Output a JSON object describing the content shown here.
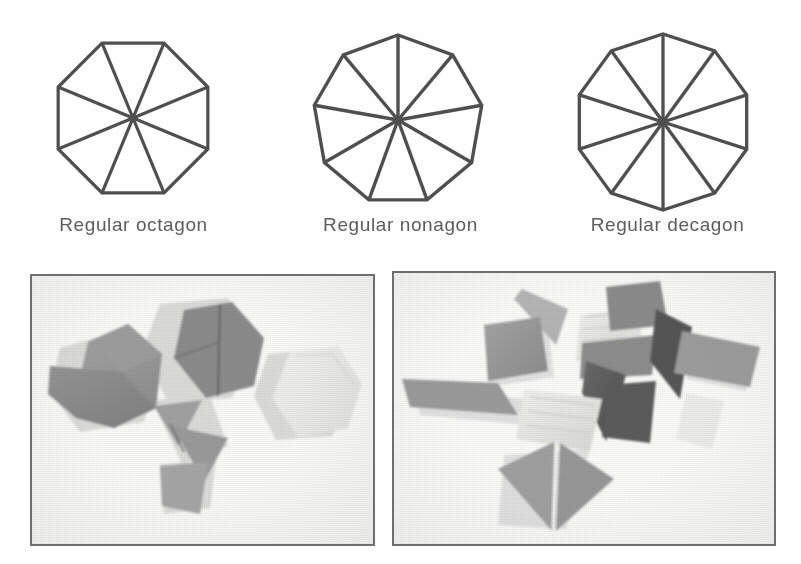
{
  "figure": {
    "background_color": "#fefefe",
    "line_color": "#4f4f4f",
    "label_color": "#5d5d5d"
  },
  "polygons": [
    {
      "name": "octagon",
      "label": "Regular octagon",
      "sides": 8,
      "cx": 133,
      "cy": 118,
      "radius": 81,
      "rotation_deg": 22.5,
      "stroke_width": 3.2,
      "radii_drawn": 8
    },
    {
      "name": "nonagon",
      "label": "Regular nonagon",
      "sides": 9,
      "cx": 131,
      "cy": 120,
      "radius": 85,
      "rotation_deg": -90,
      "stroke_width": 3.4,
      "radii_drawn": 9
    },
    {
      "name": "decagon",
      "label": "Regular decagon",
      "sides": 10,
      "cx": 129,
      "cy": 122,
      "radius": 88,
      "rotation_deg": 18,
      "stroke_width": 3.3,
      "radii_drawn": 10
    }
  ],
  "photos": [
    {
      "name": "hexagon-pieces-photo",
      "alt_text": "Photograph of grey hexagonal card pieces, some cut into triangular sectors",
      "frame_color": "#6f6f6f",
      "paper_color": "#fbfbfa",
      "pieces": [
        {
          "id": "hexagon-grey-left",
          "kind": "hexagon",
          "shade": "#9a9a9a"
        },
        {
          "id": "hexagon-sector-left-upper",
          "kind": "sector",
          "shade": "#8f8f8f"
        },
        {
          "id": "hexagon-dark-centre",
          "kind": "hexagon",
          "shade": "#8a8a8a"
        },
        {
          "id": "hexagon-white-right",
          "kind": "hexagon",
          "shade": "#efefec"
        },
        {
          "id": "triangle-upper",
          "kind": "triangle",
          "shade": "#a3a3a3"
        },
        {
          "id": "triangle-middle",
          "kind": "triangle",
          "shade": "#9d9d9d"
        },
        {
          "id": "triangle-lower",
          "kind": "triangle",
          "shade": "#a8a8a8"
        }
      ]
    },
    {
      "name": "rhombus-pieces-photo",
      "alt_text": "Photograph of scattered grey rhombus and triangular tile pieces",
      "frame_color": "#6f6f6f",
      "paper_color": "#fcfcfb",
      "pieces": [
        {
          "id": "rhombus-thin-top",
          "kind": "rhombus",
          "shade": "#b4b4b4"
        },
        {
          "id": "rhombus-top-left",
          "kind": "rhombus",
          "shade": "#9a9a9a"
        },
        {
          "id": "rhombus-left",
          "kind": "rhombus",
          "shade": "#9c9c9c"
        },
        {
          "id": "rhombus-pale-centre",
          "kind": "rhombus",
          "shade": "#e4e4e1"
        },
        {
          "id": "rhombus-mid-grey",
          "kind": "rhombus",
          "shade": "#8e8e8e"
        },
        {
          "id": "triangle-dark-centre",
          "kind": "triangle",
          "shade": "#606060"
        },
        {
          "id": "triangle-dark-right",
          "kind": "triangle",
          "shade": "#545454"
        },
        {
          "id": "rhombus-top-right",
          "kind": "rhombus",
          "shade": "#8b8b8b"
        },
        {
          "id": "rhombus-right",
          "kind": "rhombus",
          "shade": "#9d9d9d"
        },
        {
          "id": "rhombus-pale-right",
          "kind": "rhombus",
          "shade": "#ededea"
        },
        {
          "id": "triangle-bottom-left",
          "kind": "triangle",
          "shade": "#a0a0a0"
        },
        {
          "id": "triangle-bottom-right",
          "kind": "triangle",
          "shade": "#9a9a9a"
        }
      ]
    }
  ]
}
